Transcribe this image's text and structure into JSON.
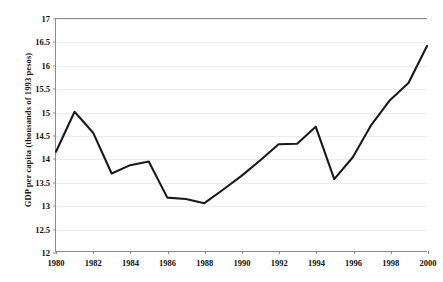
{
  "chart_data": {
    "type": "line",
    "title": "",
    "subtitle": "",
    "xlabel": "",
    "ylabel": "GDP per capita (thousands of 1993 pesos)",
    "xlim": [
      1980,
      2000
    ],
    "ylim": [
      12,
      17
    ],
    "grid": true,
    "legend": "none",
    "x": [
      1980,
      1981,
      1982,
      1983,
      1984,
      1985,
      1986,
      1987,
      1988,
      1989,
      1990,
      1991,
      1992,
      1993,
      1994,
      1995,
      1996,
      1997,
      1998,
      1999,
      2000
    ],
    "series": [
      {
        "name": "GDP per capita",
        "color": "#1a1a1a",
        "values": [
          14.14,
          15.0,
          14.55,
          13.67,
          13.85,
          13.93,
          13.15,
          13.12,
          13.03,
          13.32,
          13.62,
          13.95,
          14.3,
          14.31,
          14.68,
          13.55,
          14.02,
          14.72,
          15.25,
          15.62,
          16.42
        ]
      }
    ],
    "xticks": [
      1980,
      1982,
      1984,
      1986,
      1988,
      1990,
      1992,
      1994,
      1996,
      1998,
      2000
    ],
    "xtick_labels": [
      "1980",
      "1982",
      "1984",
      "1986",
      "1988",
      "1990",
      "1992",
      "1994",
      "1996",
      "1998",
      "2000"
    ],
    "yticks": [
      12,
      12.5,
      13,
      13.5,
      14,
      14.5,
      15,
      15.5,
      16,
      16.5,
      17
    ],
    "ytick_labels": [
      "12",
      "12.5",
      "13",
      "13.5",
      "14",
      "14.5",
      "15",
      "15.5",
      "16",
      "16.5",
      "17"
    ],
    "colors": {
      "line": "#1a1a1a",
      "grid": "#ededed",
      "axis": "#8d8d8d",
      "text": "#111111",
      "background": "#ffffff"
    }
  }
}
